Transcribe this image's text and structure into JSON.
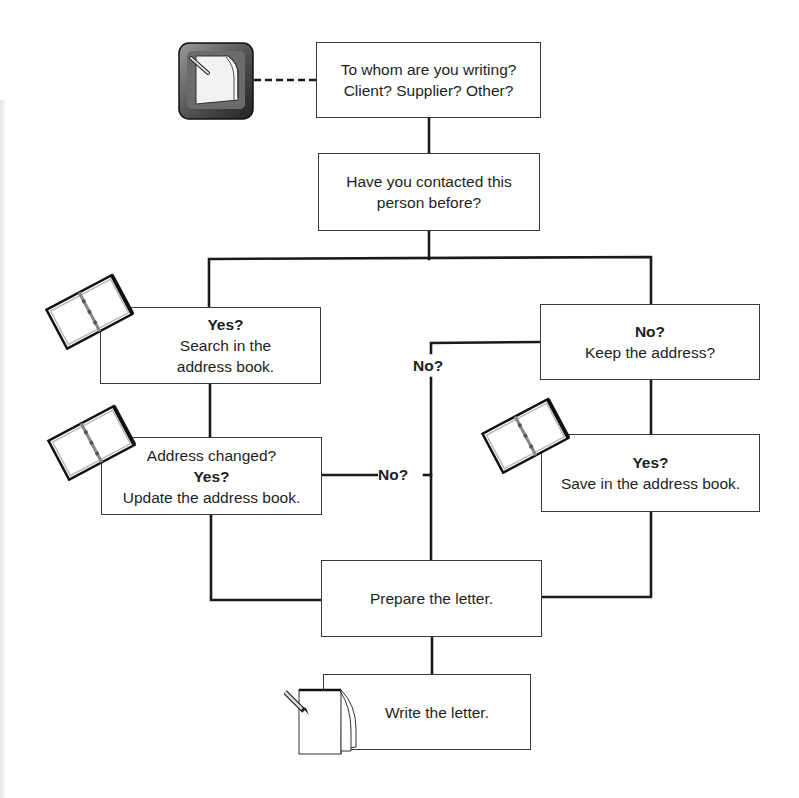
{
  "diagram": {
    "type": "flowchart",
    "nodes": {
      "start": {
        "line1": "To whom are you writing?",
        "line2": "Client? Supplier? Other?"
      },
      "contacted": {
        "line1": "Have you contacted this",
        "line2": "person before?"
      },
      "yes_search": {
        "heading": "Yes?",
        "line1": "Search in the",
        "line2": "address book."
      },
      "no_keep": {
        "heading": "No?",
        "line1": "Keep the address?"
      },
      "address_changed": {
        "line1": "Address changed?",
        "heading": "Yes?",
        "line2": "Update the address book."
      },
      "yes_save": {
        "heading": "Yes?",
        "line1": "Save in the address book."
      },
      "prepare": {
        "line1": "Prepare the letter."
      },
      "write": {
        "line1": "Write the letter."
      }
    },
    "edge_labels": {
      "keep_no": "No?",
      "changed_no": "No?"
    },
    "icons": {
      "start_icon": "keyboard-key-document-pencil-icon",
      "address_book_icon": "address-book-icon",
      "write_icon": "notepad-pencil-icon"
    },
    "colors": {
      "line": "#1a1a1a",
      "box_border": "#3a3a3a",
      "background": "#ffffff",
      "text": "#1e1e1e"
    }
  }
}
